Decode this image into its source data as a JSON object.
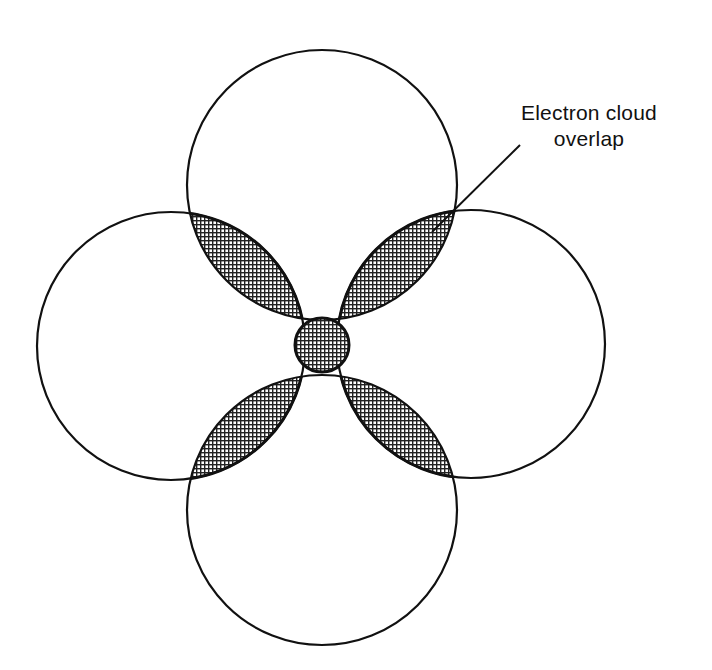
{
  "diagram": {
    "type": "electron-cloud-overlap",
    "annotation": {
      "line1": "Electron cloud",
      "line2": "overlap"
    },
    "colors": {
      "stroke": "#111111",
      "background": "#ffffff",
      "stipple": "#222222"
    },
    "circles": [
      {
        "name": "top-atom",
        "cx": 322,
        "cy": 185,
        "r": 135
      },
      {
        "name": "left-atom",
        "cx": 171,
        "cy": 346,
        "r": 134
      },
      {
        "name": "right-atom",
        "cx": 471,
        "cy": 344,
        "r": 134
      },
      {
        "name": "bottom-atom",
        "cx": 322,
        "cy": 510,
        "r": 135
      },
      {
        "name": "central-atom",
        "cx": 322,
        "cy": 345,
        "r": 27
      }
    ]
  }
}
